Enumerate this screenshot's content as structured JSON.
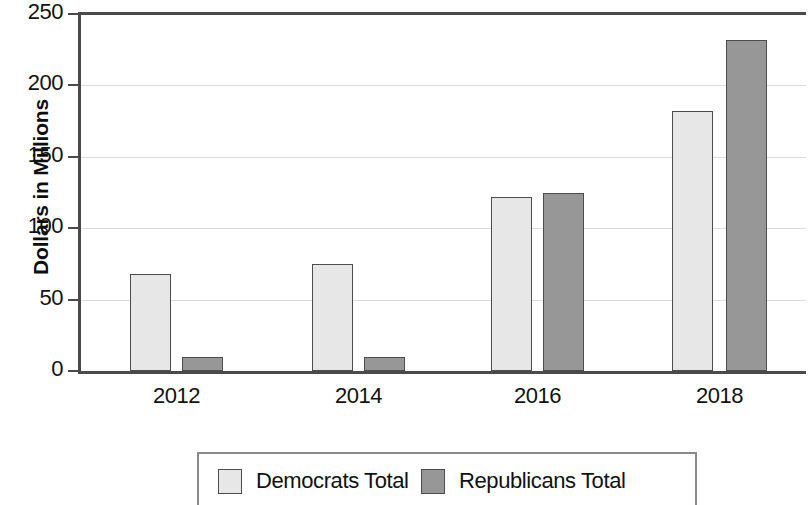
{
  "chart_data": {
    "type": "bar",
    "title": "",
    "xlabel": "",
    "ylabel": "Dollars in Millions",
    "categories": [
      "2012",
      "2014",
      "2016",
      "2018"
    ],
    "series": [
      {
        "name": "Democrats Total",
        "color": "#e7e7e7",
        "values": [
          68,
          75,
          122,
          182
        ]
      },
      {
        "name": "Republicans Total",
        "color": "#979797",
        "values": [
          10,
          10,
          125,
          232
        ]
      }
    ],
    "ylim": [
      0,
      250
    ],
    "yticks": [
      "0",
      "50",
      "100",
      "150",
      "200",
      "250"
    ],
    "ytick_values": [
      0,
      50,
      100,
      150,
      200,
      250
    ],
    "grid": true,
    "legend_position": "bottom"
  },
  "legend": {
    "items": [
      {
        "label": "Democrats Total",
        "swatch": "dem"
      },
      {
        "label": "Republicans Total",
        "swatch": "rep"
      }
    ]
  }
}
